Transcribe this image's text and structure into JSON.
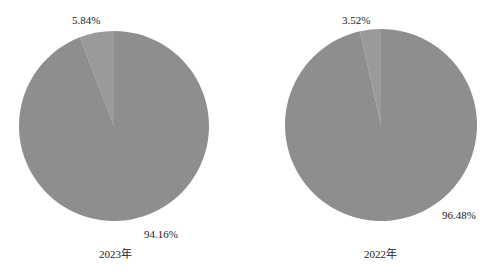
{
  "chart_data": [
    {
      "type": "pie",
      "title": "2023年",
      "categories": [
        "slice_a",
        "slice_b"
      ],
      "values": [
        5.84,
        94.16
      ],
      "labels": [
        "5.84%",
        "94.16%"
      ],
      "colors": [
        "#9a9a9a",
        "#8e8e8e"
      ]
    },
    {
      "type": "pie",
      "title": "2022年",
      "categories": [
        "slice_a",
        "slice_b"
      ],
      "values": [
        3.52,
        96.48
      ],
      "labels": [
        "3.52%",
        "96.48%"
      ],
      "colors": [
        "#9a9a9a",
        "#8e8e8e"
      ]
    }
  ]
}
